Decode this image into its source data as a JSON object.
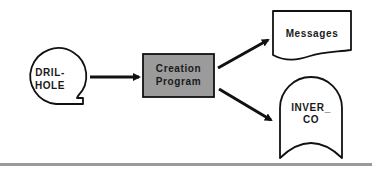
{
  "diagram": {
    "type": "flowchart",
    "nodes": {
      "input": {
        "shape": "online-storage-speech-bubble",
        "line1": "DRIL-",
        "line2": "HOLE"
      },
      "process": {
        "shape": "process-box",
        "line1": "Creation",
        "line2": "Program",
        "fill": "#9b9b9b"
      },
      "output_doc": {
        "shape": "document",
        "label": "Messages"
      },
      "output_store": {
        "shape": "magnetic-tape-storage",
        "line1": "INVER_",
        "line2": "CO"
      }
    },
    "edges": [
      {
        "from": "DRIL-HOLE",
        "to": "Creation Program"
      },
      {
        "from": "Creation Program",
        "to": "Messages"
      },
      {
        "from": "Creation Program",
        "to": "INVER_CO"
      }
    ],
    "colors": {
      "stroke": "#111111",
      "process_fill": "#9b9b9b",
      "rule": "#9a9a9a"
    }
  }
}
